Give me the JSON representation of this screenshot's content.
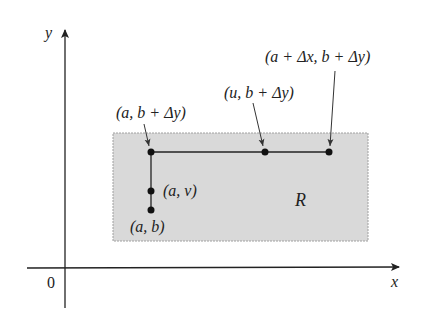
{
  "diagram": {
    "axes": {
      "x_label": "x",
      "y_label": "y",
      "origin_label": "0"
    },
    "region": {
      "label": "R",
      "fill": "#d9d9d9",
      "border": "#9a9a9a"
    },
    "points": [
      {
        "id": "a_b",
        "label": "(a, b)"
      },
      {
        "id": "a_v",
        "label": "(a, v)"
      },
      {
        "id": "a_b_dy",
        "label": "(a, b + Δy)"
      },
      {
        "id": "u_b_dy",
        "label": "(u, b + Δy)"
      },
      {
        "id": "a_dx_b_dy",
        "label": "(a + Δx, b + Δy)"
      }
    ]
  }
}
